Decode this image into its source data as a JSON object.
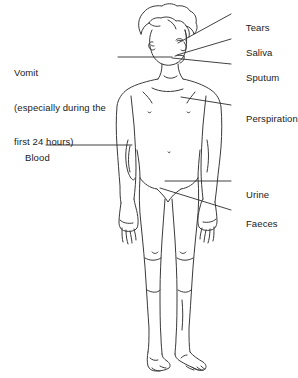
{
  "figure": {
    "stroke_color": "#3a3a3a",
    "text_color": "#1a1a1a",
    "background_color": "#ffffff"
  },
  "annotations": {
    "tears": {
      "label": "Tears",
      "text_x": 235,
      "text_y": 10,
      "leader": {
        "x1": 231,
        "y1": 14,
        "x2": 178,
        "y2": 43
      }
    },
    "saliva": {
      "label": "Saliva",
      "text_x": 235,
      "text_y": 35,
      "leader": {
        "x1": 231,
        "y1": 39,
        "x2": 177,
        "y2": 55
      }
    },
    "sputum": {
      "label": "Sputum",
      "text_x": 235,
      "text_y": 60,
      "leader": {
        "x1": 231,
        "y1": 64,
        "x2": 172,
        "y2": 58
      }
    },
    "perspiration": {
      "label": "Perspiration",
      "text_x": 235,
      "text_y": 101,
      "leader": {
        "x1": 231,
        "y1": 105,
        "x2": 181,
        "y2": 97
      }
    },
    "urine": {
      "label": "Urine",
      "text_x": 235,
      "text_y": 177,
      "leader": {
        "x1": 231,
        "y1": 181,
        "x2": 165,
        "y2": 181
      }
    },
    "faeces": {
      "label": "Faeces",
      "text_x": 235,
      "text_y": 206,
      "leader": {
        "x1": 231,
        "y1": 210,
        "x2": 160,
        "y2": 188
      }
    },
    "vomit": {
      "label": "Vomit\n(especially during the\nfirst 24 hours)",
      "line1": "Vomit",
      "line2": "(especially during the",
      "line3": "first 24 hours)",
      "text_x": 14,
      "text_y": 44,
      "leader": {
        "x1": 118,
        "y1": 57,
        "x2": 167,
        "y2": 57
      }
    },
    "blood": {
      "label": "Blood",
      "text_x": 14,
      "text_y": 140,
      "leader": {
        "x1": 46,
        "y1": 145,
        "x2": 132,
        "y2": 145
      }
    }
  }
}
